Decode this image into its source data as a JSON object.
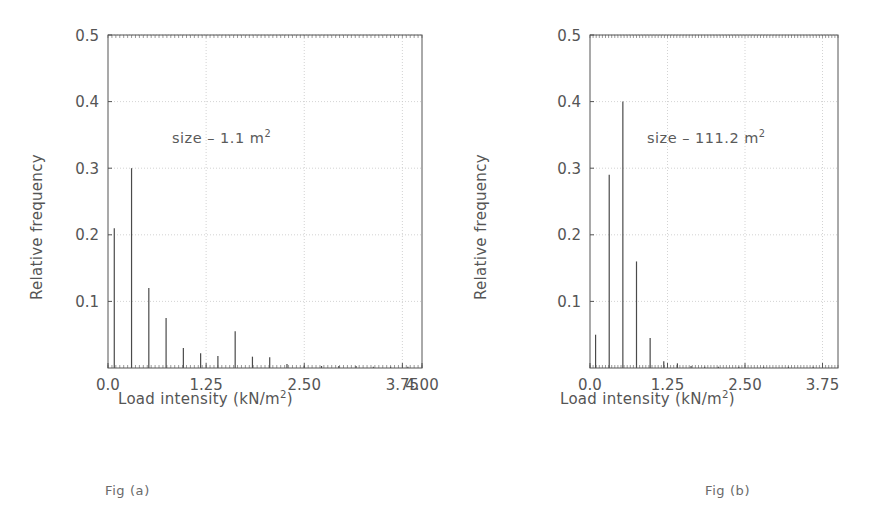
{
  "page": {
    "background": "#ffffff",
    "axis_color": "#555555",
    "grid_color": "#c8c8c8",
    "bar_color": "#4a4a4a",
    "text_color": "#555555"
  },
  "figures": [
    {
      "id": "a",
      "caption": "Fig (a)",
      "annotation_prefix": "size",
      "annotation_dash": "–",
      "annotation_value": "1.1",
      "annotation_unit": "m",
      "annotation_unit_exp": "2",
      "annotation_full": "size – 1.1 m2",
      "xlabel_main": "Load intensity (kN/m",
      "xlabel_exp": "2",
      "xlabel_tail": ")",
      "xlabel_full": "Load intensity (kN/m2)",
      "ylabel": "Relative frequency",
      "chart_data": {
        "type": "bar",
        "title": "",
        "subtitle": "size – 1.1 m2",
        "xlabel": "Load intensity (kN/m2)",
        "ylabel": "Relative frequency",
        "xlim": [
          0.0,
          4.0
        ],
        "ylim": [
          0.0,
          0.5
        ],
        "xticks": [
          0.0,
          1.25,
          2.5,
          3.75,
          4.0
        ],
        "xticklabels": [
          "0.0",
          "1.25",
          "2.50",
          "3.75",
          "4.00"
        ],
        "yticks": [
          0.1,
          0.2,
          0.3,
          0.4,
          0.5
        ],
        "yticklabels": [
          "0.1",
          "0.2",
          "0.3",
          "0.4",
          "0.5"
        ],
        "grid": true,
        "legend": "none",
        "x": [
          0.08,
          0.3,
          0.52,
          0.74,
          0.96,
          1.18,
          1.4,
          1.62,
          1.84,
          2.06,
          2.28,
          2.5,
          2.72,
          2.94,
          3.16,
          3.38,
          3.6,
          3.82
        ],
        "values": [
          0.21,
          0.3,
          0.12,
          0.075,
          0.03,
          0.022,
          0.018,
          0.055,
          0.017,
          0.016,
          0.006,
          0.003,
          0.003,
          0.003,
          0.003,
          0.002,
          0.002,
          0.002
        ]
      }
    },
    {
      "id": "b",
      "caption": "Fig (b)",
      "annotation_prefix": "size",
      "annotation_dash": "–",
      "annotation_value": "111.2",
      "annotation_unit": "m",
      "annotation_unit_exp": "2",
      "annotation_full": "size – 111.2 m2",
      "xlabel_main": "Load intensity (kN/m",
      "xlabel_exp": "2",
      "xlabel_tail": ")",
      "xlabel_full": "Load intensity (kN/m2)",
      "ylabel": "Relative frequency",
      "chart_data": {
        "type": "bar",
        "title": "",
        "subtitle": "size – 111.2 m2",
        "xlabel": "Load intensity (kN/m2)",
        "ylabel": "Relative frequency",
        "xlim": [
          0.0,
          4.0
        ],
        "ylim": [
          0.0,
          0.5
        ],
        "xticks": [
          0.0,
          1.25,
          2.5,
          3.75
        ],
        "xticklabels": [
          "0.0",
          "1.25",
          "2.50",
          "3.75"
        ],
        "yticks": [
          0.1,
          0.2,
          0.3,
          0.4,
          0.5
        ],
        "yticklabels": [
          "0.1",
          "0.2",
          "0.3",
          "0.4",
          "0.5"
        ],
        "grid": true,
        "legend": "none",
        "x": [
          0.09,
          0.31,
          0.53,
          0.75,
          0.97,
          1.19,
          1.41,
          1.63,
          1.85,
          2.07,
          2.4,
          2.8,
          3.2,
          3.6
        ],
        "values": [
          0.05,
          0.29,
          0.4,
          0.16,
          0.045,
          0.01,
          0.007,
          0.003,
          0.002,
          0.002,
          0.002,
          0.002,
          0.002,
          0.002
        ]
      }
    }
  ]
}
